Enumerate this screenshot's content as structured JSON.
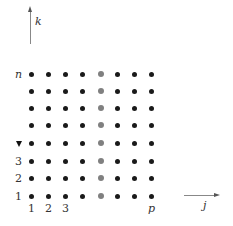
{
  "diagram": {
    "axes": {
      "vertical": {
        "label": "k"
      },
      "horizontal": {
        "label": "j"
      }
    },
    "row_labels": [
      "1",
      "2",
      "3",
      "",
      "",
      "",
      "",
      "n"
    ],
    "column_labels": [
      "1",
      "2",
      "3",
      "",
      "",
      "",
      "",
      "p"
    ],
    "grid": {
      "rows": 8,
      "columns": 8,
      "highlighted_column_index": 4
    },
    "colors": {
      "dot": "#1a1a1a",
      "highlighted_dot": "#808080",
      "axis": "#888888"
    }
  }
}
